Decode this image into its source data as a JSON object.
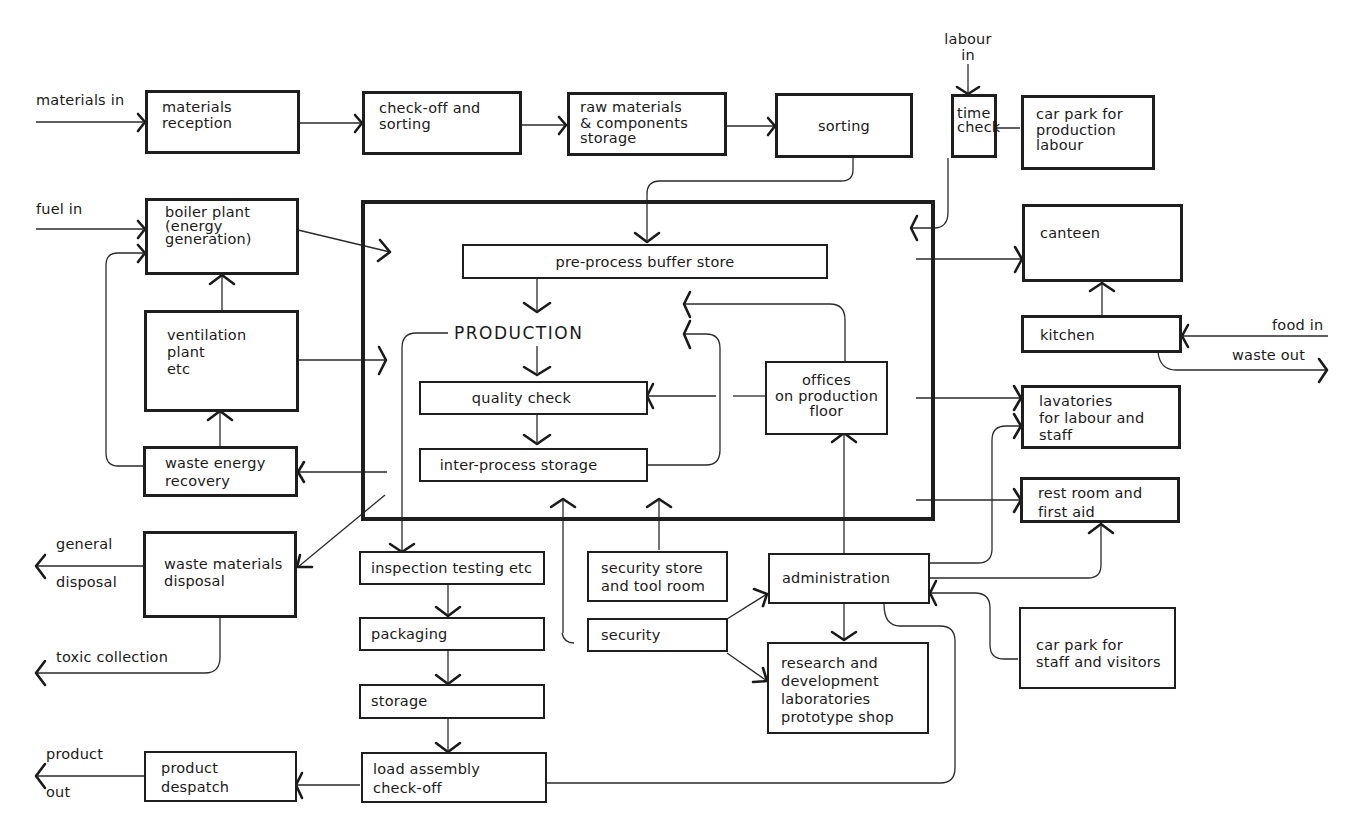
{
  "diagram": {
    "type": "factory layout flow diagram",
    "inputs": {
      "materials_in": "materials in",
      "fuel_in": "fuel in",
      "labour_in": "labour\nin",
      "food_in": "food in"
    },
    "outputs": {
      "waste_out": "waste out",
      "general": "general",
      "disposal": "disposal",
      "toxic_collection": "toxic collection",
      "product": "product",
      "out": "out"
    },
    "boxes": {
      "materials_reception": "materials\nreception",
      "check_off_sorting": "check-off and\nsorting",
      "raw_materials_storage": "raw materials\n& components\nstorage",
      "sorting": "sorting",
      "time_check": "time\ncheck",
      "car_park_production": "car park for\nproduction\nlabour",
      "boiler_plant": "boiler plant\n(energy\ngeneration)",
      "ventilation_plant": "ventilation\nplant\netc",
      "waste_energy_recovery": "waste energy\nrecovery",
      "waste_materials_disposal": "waste materials\ndisposal",
      "canteen": "canteen",
      "kitchen": "kitchen",
      "lavatories": "lavatories\nfor labour and\nstaff",
      "rest_room": "rest room and\nfirst aid",
      "pre_process_buffer": "pre-process buffer store",
      "production_title": "PRODUCTION",
      "quality_check": "quality check",
      "inter_process_storage": "inter-process storage",
      "offices_production_floor": "offices\non production\nfloor",
      "inspection_testing": "inspection testing etc",
      "packaging": "packaging",
      "storage": "storage",
      "load_assembly": "load assembly\ncheck-off",
      "product_despatch": "product\ndespatch",
      "security_store": "security store\nand tool room",
      "security": "security",
      "administration": "administration",
      "research_development": "research and\ndevelopment\nlaboratories\nprototype shop",
      "car_park_staff": "car park for\nstaff and visitors"
    },
    "connections": [
      [
        "materials in",
        "materials reception"
      ],
      [
        "materials reception",
        "check-off and sorting"
      ],
      [
        "check-off and sorting",
        "raw materials & components storage"
      ],
      [
        "raw materials & components storage",
        "sorting"
      ],
      [
        "sorting",
        "pre-process buffer store"
      ],
      [
        "labour in",
        "time check"
      ],
      [
        "car park for production labour",
        "time check"
      ],
      [
        "time check",
        "production area"
      ],
      [
        "fuel in",
        "boiler plant"
      ],
      [
        "boiler plant",
        "production area"
      ],
      [
        "ventilation plant",
        "boiler plant"
      ],
      [
        "ventilation plant",
        "production area"
      ],
      [
        "waste energy recovery",
        "ventilation plant"
      ],
      [
        "waste energy recovery",
        "boiler plant"
      ],
      [
        "production area",
        "waste energy recovery"
      ],
      [
        "production area",
        "waste materials disposal"
      ],
      [
        "waste materials disposal",
        "general disposal"
      ],
      [
        "waste materials disposal",
        "toxic collection"
      ],
      [
        "production area",
        "canteen"
      ],
      [
        "kitchen",
        "canteen"
      ],
      [
        "food in",
        "kitchen"
      ],
      [
        "kitchen",
        "waste out"
      ],
      [
        "production area",
        "lavatories"
      ],
      [
        "production area",
        "rest room and first aid"
      ],
      [
        "pre-process buffer store",
        "PRODUCTION"
      ],
      [
        "PRODUCTION",
        "quality check"
      ],
      [
        "quality check",
        "inter-process storage"
      ],
      [
        "inter-process storage",
        "PRODUCTION"
      ],
      [
        "offices on production floor",
        "quality check"
      ],
      [
        "offices on production floor",
        "PRODUCTION"
      ],
      [
        "PRODUCTION",
        "inspection testing etc"
      ],
      [
        "inspection testing etc",
        "packaging"
      ],
      [
        "packaging",
        "storage"
      ],
      [
        "storage",
        "load assembly check-off"
      ],
      [
        "load assembly check-off",
        "product despatch"
      ],
      [
        "product despatch",
        "product out"
      ],
      [
        "security store and tool room",
        "production area"
      ],
      [
        "security",
        "production area"
      ],
      [
        "security",
        "administration"
      ],
      [
        "security",
        "research and development"
      ],
      [
        "administration",
        "offices on production floor"
      ],
      [
        "administration",
        "research and development"
      ],
      [
        "administration",
        "lavatories"
      ],
      [
        "administration",
        "rest room and first aid"
      ],
      [
        "car park for staff and visitors",
        "administration"
      ],
      [
        "administration",
        "load assembly check-off"
      ]
    ]
  }
}
